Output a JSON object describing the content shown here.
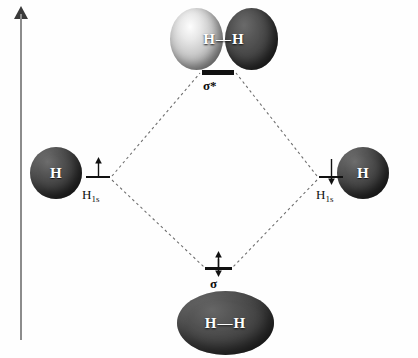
{
  "figure": {
    "axis": {
      "name": "energy-axis",
      "direction": "up"
    }
  },
  "orbitals": {
    "antibonding": {
      "level_label": "σ*",
      "picture_label": "H—H",
      "electron_count": 0,
      "phases": [
        "light",
        "dark"
      ],
      "color_light": "#e8e8e8",
      "color_dark": "#333333"
    },
    "bonding": {
      "level_label": "σ",
      "picture_label": "H—H",
      "electron_count": 2,
      "electrons": [
        "up",
        "down"
      ],
      "color": "#3b3b3b"
    }
  },
  "atomic_orbitals": {
    "left": {
      "sphere_label": "H",
      "level_label": "H",
      "level_sublabel": "1s",
      "electron_count": 1,
      "electrons": [
        "up"
      ],
      "color": "#3b3b3b"
    },
    "right": {
      "sphere_label": "H",
      "level_label": "H",
      "level_sublabel": "1s",
      "electron_count": 1,
      "electrons": [
        "down"
      ],
      "color": "#3b3b3b"
    }
  },
  "colors": {
    "level_bar": "#111111",
    "dashed_line": "#6f6f6f",
    "axis": "#8c8c8c",
    "background": "#fefefe"
  }
}
